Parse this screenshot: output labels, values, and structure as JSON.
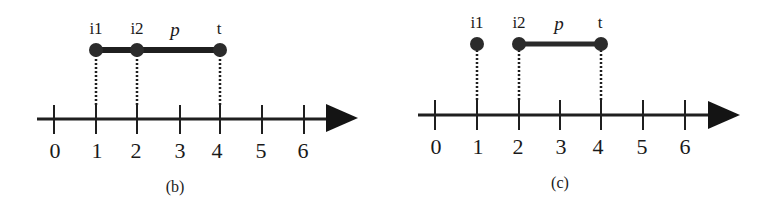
{
  "colors": {
    "ink": "#1a1a1a",
    "dot": "#2b2b2b",
    "background": "#ffffff"
  },
  "panels": [
    {
      "id": "b",
      "caption": "(b)",
      "axis": {
        "ticks": [
          "0",
          "1",
          "2",
          "3",
          "4",
          "5",
          "6"
        ]
      },
      "points": [
        {
          "label": "i1",
          "value": 1
        },
        {
          "label": "i2",
          "value": 2
        },
        {
          "label": "t",
          "value": 4
        }
      ],
      "path": {
        "label": "p",
        "from": 1,
        "to": 4
      }
    },
    {
      "id": "c",
      "caption": "(c)",
      "axis": {
        "ticks": [
          "0",
          "1",
          "2",
          "3",
          "4",
          "5",
          "6"
        ]
      },
      "points": [
        {
          "label": "i1",
          "value": 1
        },
        {
          "label": "i2",
          "value": 2
        },
        {
          "label": "t",
          "value": 4
        }
      ],
      "path": {
        "label": "p",
        "from": 2,
        "to": 4
      }
    }
  ]
}
